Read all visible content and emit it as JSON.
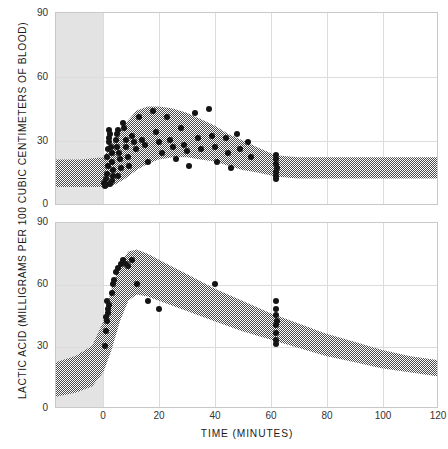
{
  "chart_data": {
    "type": "scatter",
    "title": "",
    "xlabel": "TIME (MINUTES)",
    "ylabel": "LACTIC ACID (MILLIGRAMS PER 100 CUBIC CENTIMETERS OF BLOOD)",
    "xlim": [
      -17,
      120
    ],
    "ylim": [
      0,
      90
    ],
    "xticks": [
      0,
      20,
      40,
      60,
      80,
      100,
      120
    ],
    "yticks": [
      0,
      30,
      60,
      90
    ],
    "grid": true,
    "legend": "none",
    "panels": [
      {
        "name": "top-panel",
        "ylim": [
          0,
          90
        ],
        "yticks": [
          0,
          30,
          60,
          90
        ],
        "rest_zone": {
          "x_start": -17,
          "x_end": 0,
          "label": "rest period shading"
        },
        "band": {
          "style": "hatched",
          "x": [
            -17,
            -8,
            0,
            4,
            8,
            12,
            16,
            20,
            25,
            30,
            35,
            40,
            45,
            50,
            55,
            62,
            70,
            80,
            90,
            100,
            110,
            120
          ],
          "upper": [
            21,
            21,
            22,
            30,
            38,
            44,
            46,
            46,
            45,
            43,
            40,
            37,
            33,
            30,
            27,
            23,
            22,
            22,
            22,
            22,
            22,
            22
          ],
          "lower": [
            8,
            8,
            8,
            9,
            12,
            16,
            19,
            21,
            22,
            22,
            21,
            20,
            18,
            16,
            15,
            13,
            12,
            12,
            12,
            12,
            12,
            12
          ]
        },
        "points": [
          [
            0.2,
            10
          ],
          [
            0.5,
            8.5
          ],
          [
            0.8,
            12
          ],
          [
            1.0,
            9
          ],
          [
            1.4,
            14
          ],
          [
            1.6,
            18
          ],
          [
            1.2,
            22
          ],
          [
            1.8,
            26
          ],
          [
            2.0,
            29
          ],
          [
            2.2,
            31
          ],
          [
            2.4,
            33
          ],
          [
            1.9,
            35
          ],
          [
            2.8,
            27
          ],
          [
            3.0,
            24
          ],
          [
            3.2,
            20
          ],
          [
            3.4,
            16
          ],
          [
            3.6,
            13
          ],
          [
            3.0,
            11
          ],
          [
            2.4,
            9.5
          ],
          [
            4.5,
            30
          ],
          [
            5.0,
            33
          ],
          [
            5.4,
            35
          ],
          [
            4.8,
            27
          ],
          [
            5.6,
            24
          ],
          [
            6.0,
            21
          ],
          [
            6.4,
            17
          ],
          [
            5.2,
            13
          ],
          [
            7.0,
            38
          ],
          [
            7.6,
            36
          ],
          [
            8.2,
            30
          ],
          [
            8.0,
            27
          ],
          [
            8.8,
            22
          ],
          [
            9.4,
            18
          ],
          [
            10.5,
            32
          ],
          [
            11.0,
            29
          ],
          [
            11.6,
            26
          ],
          [
            13.0,
            41
          ],
          [
            14.0,
            30
          ],
          [
            15.0,
            28
          ],
          [
            16.0,
            20
          ],
          [
            18.0,
            44
          ],
          [
            19.0,
            34
          ],
          [
            20.0,
            29
          ],
          [
            21.0,
            24
          ],
          [
            23.0,
            41
          ],
          [
            24.0,
            30
          ],
          [
            25.0,
            27
          ],
          [
            26.0,
            21
          ],
          [
            28.0,
            36
          ],
          [
            29.0,
            28
          ],
          [
            30.0,
            25
          ],
          [
            31.0,
            18
          ],
          [
            33.0,
            43
          ],
          [
            34.0,
            31
          ],
          [
            35.0,
            26
          ],
          [
            38.0,
            45
          ],
          [
            39.0,
            32
          ],
          [
            40.0,
            27
          ],
          [
            41.0,
            20
          ],
          [
            44.0,
            31
          ],
          [
            45.0,
            24
          ],
          [
            46.0,
            17
          ],
          [
            48.0,
            33
          ],
          [
            49.0,
            26
          ],
          [
            52.0,
            29
          ],
          [
            53.0,
            22
          ],
          [
            62.0,
            23
          ],
          [
            62.2,
            21
          ],
          [
            62.0,
            19
          ],
          [
            62.3,
            17
          ],
          [
            62.1,
            15
          ],
          [
            62.2,
            13
          ],
          [
            62.0,
            12
          ]
        ]
      },
      {
        "name": "bottom-panel",
        "ylim": [
          0,
          90
        ],
        "yticks": [
          0,
          30,
          60,
          90
        ],
        "rest_zone": {
          "x_start": -17,
          "x_end": 0,
          "label": "rest period shading"
        },
        "band": {
          "style": "hatched",
          "x": [
            -17,
            -10,
            -4,
            0,
            3,
            6,
            9,
            12,
            16,
            20,
            30,
            40,
            50,
            60,
            70,
            80,
            90,
            100,
            110,
            120
          ],
          "upper": [
            22,
            25,
            30,
            42,
            58,
            70,
            76,
            77,
            75,
            72,
            65,
            58,
            52,
            46,
            41,
            36,
            32,
            28,
            25,
            23
          ],
          "lower": [
            5,
            7,
            10,
            17,
            28,
            42,
            52,
            55,
            54,
            52,
            47,
            42,
            37,
            33,
            29,
            25,
            22,
            19,
            17,
            15
          ]
        },
        "points": [
          [
            0.5,
            30
          ],
          [
            1.0,
            37
          ],
          [
            1.4,
            42
          ],
          [
            1.0,
            44
          ],
          [
            1.6,
            46
          ],
          [
            1.8,
            48
          ],
          [
            2.0,
            50
          ],
          [
            1.2,
            52
          ],
          [
            3.0,
            56
          ],
          [
            3.4,
            60
          ],
          [
            4.0,
            62
          ],
          [
            4.6,
            66
          ],
          [
            5.4,
            68
          ],
          [
            6.2,
            70
          ],
          [
            7.0,
            72
          ],
          [
            8.0,
            70
          ],
          [
            9.0,
            69
          ],
          [
            10.5,
            72
          ],
          [
            12.0,
            60
          ],
          [
            16.0,
            52
          ],
          [
            20.0,
            48
          ],
          [
            40.0,
            60
          ],
          [
            62.0,
            52
          ],
          [
            62.2,
            48
          ],
          [
            62.0,
            45
          ],
          [
            62.3,
            42
          ],
          [
            62.1,
            40
          ],
          [
            62.0,
            36
          ],
          [
            62.2,
            33
          ],
          [
            62.0,
            31
          ]
        ]
      }
    ]
  },
  "axes": {
    "y_title": "LACTIC ACID (MILLIGRAMS PER 100 CUBIC CENTIMETERS OF BLOOD)",
    "x_title": "TIME (MINUTES)",
    "y_tick_labels": [
      "90",
      "60",
      "30",
      "0"
    ],
    "x_tick_labels": [
      "0",
      "20",
      "40",
      "60",
      "80",
      "100",
      "120"
    ]
  },
  "colors": {
    "background": "#ffffff",
    "rest_zone": "#e3e3e3",
    "grid": "#dcdcdc",
    "frame": "#c9c9c9",
    "point": "#141414",
    "band_hatch": "#4a4a4a",
    "text": "#1a1a1a"
  }
}
